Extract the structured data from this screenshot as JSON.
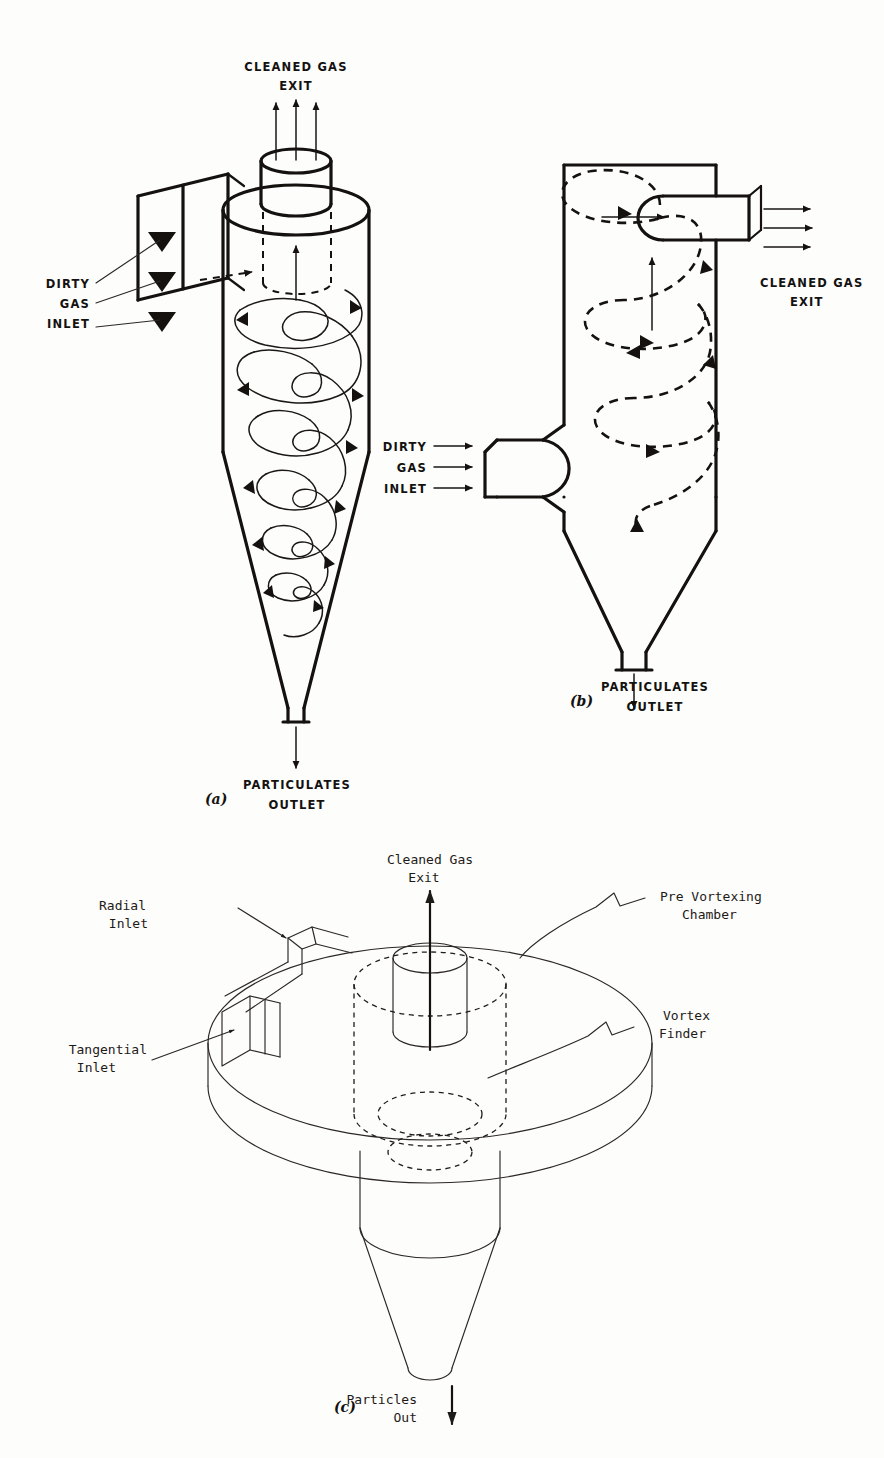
{
  "figure": {
    "background_color": "#fdfdfc",
    "ink_color": "#14110f"
  },
  "panel_a": {
    "caption": "(a)",
    "labels": {
      "cleaned_gas_exit_line1": "CLEANED GAS",
      "cleaned_gas_exit_line2": "EXIT",
      "dirty_gas_inlet_line1": "DIRTY",
      "dirty_gas_inlet_line2": "GAS",
      "dirty_gas_inlet_line3": "INLET",
      "particulates_outlet_line1": "PARTICULATES",
      "particulates_outlet_line2": "OUTLET"
    }
  },
  "panel_b": {
    "caption": "(b)",
    "labels": {
      "cleaned_gas_exit_line1": "CLEANED GAS",
      "cleaned_gas_exit_line2": "EXIT",
      "dirty_gas_inlet_line1": "DIRTY",
      "dirty_gas_inlet_line2": "GAS",
      "dirty_gas_inlet_line3": "INLET",
      "particulates_outlet_line1": "PARTICULATES",
      "particulates_outlet_line2": "OUTLET"
    }
  },
  "panel_c": {
    "caption": "(c)",
    "labels": {
      "cleaned_gas_exit_line1": "Cleaned Gas",
      "cleaned_gas_exit_line2": "Exit",
      "radial_inlet_line1": "Radial",
      "radial_inlet_line2": "Inlet",
      "tangential_inlet_line1": "Tangential",
      "tangential_inlet_line2": "Inlet",
      "pre_vortexing_chamber_line1": "Pre Vortexing",
      "pre_vortexing_chamber_line2": "Chamber",
      "vortex_finder_line1": "Vortex",
      "vortex_finder_line2": "Finder",
      "particles_out_line1": "Particles",
      "particles_out_line2": "Out"
    }
  }
}
